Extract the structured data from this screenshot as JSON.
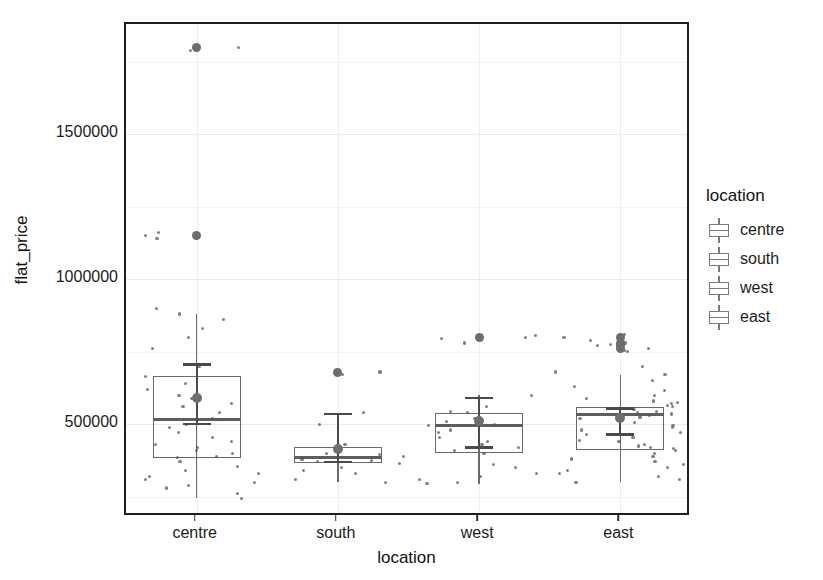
{
  "chart_data": {
    "type": "box",
    "title": "",
    "xlabel": "location",
    "ylabel": "flat_price",
    "categories": [
      "centre",
      "south",
      "west",
      "east"
    ],
    "xlim": [
      0.5,
      4.5
    ],
    "ylim": [
      180000,
      1880000
    ],
    "y_ticks": [
      500000,
      1000000,
      1500000
    ],
    "y_tick_labels": [
      "500000",
      "1000000",
      "1500000"
    ],
    "y_minor_ticks": [
      250000,
      750000,
      1250000,
      1750000
    ],
    "grid": true,
    "legend": {
      "title": "location",
      "position": "right",
      "entries": [
        "centre",
        "south",
        "west",
        "east"
      ]
    },
    "colors": {
      "box_stroke": "#6a6a6a",
      "median": "#5e5e5e",
      "point": "#555555",
      "outlier": "#6d6d6d",
      "mean_marker": "#4a4a4a",
      "panel_border": "#1e1e1e",
      "grid_major": "#eaeaea",
      "grid_minor": "#f4f4f4",
      "text": "#1c1c1c"
    },
    "series": [
      {
        "name": "centre",
        "q1": 385000,
        "median": 515000,
        "q3": 665000,
        "whisker_low": 245000,
        "whisker_high": 880000,
        "mean": 590000,
        "mean_ci_low": 500000,
        "mean_ci_high": 705000,
        "outliers": [
          1800000,
          1150000
        ],
        "points": [
          1800000,
          1790000,
          1160000,
          1150000,
          1140000,
          900000,
          880000,
          860000,
          830000,
          800000,
          760000,
          700000,
          665000,
          640000,
          620000,
          600000,
          590000,
          570000,
          560000,
          540000,
          520000,
          515000,
          500000,
          490000,
          470000,
          455000,
          440000,
          430000,
          420000,
          410000,
          400000,
          390000,
          385000,
          370000,
          355000,
          340000,
          330000,
          320000,
          310000,
          300000,
          290000,
          280000,
          260000,
          245000
        ]
      },
      {
        "name": "south",
        "q1": 365000,
        "median": 385000,
        "q3": 420000,
        "whisker_low": 300000,
        "whisker_high": 540000,
        "mean": 415000,
        "mean_ci_low": 370000,
        "mean_ci_high": 535000,
        "outliers": [
          680000
        ],
        "points": [
          680000,
          670000,
          540000,
          500000,
          430000,
          420000,
          410000,
          400000,
          395000,
          390000,
          385000,
          380000,
          375000,
          370000,
          365000,
          350000,
          340000,
          330000,
          310000,
          300000
        ]
      },
      {
        "name": "west",
        "q1": 400000,
        "median": 495000,
        "q3": 540000,
        "whisker_low": 295000,
        "whisker_high": 600000,
        "mean": 510000,
        "mean_ci_low": 420000,
        "mean_ci_high": 590000,
        "outliers": [
          800000
        ],
        "points": [
          805000,
          800000,
          795000,
          780000,
          600000,
          560000,
          545000,
          540000,
          520000,
          510000,
          500000,
          495000,
          480000,
          470000,
          455000,
          440000,
          430000,
          420000,
          410000,
          400000,
          360000,
          350000,
          330000,
          320000,
          310000,
          300000,
          295000
        ]
      },
      {
        "name": "east",
        "q1": 410000,
        "median": 535000,
        "q3": 560000,
        "whisker_low": 300000,
        "whisker_high": 670000,
        "mean": 520000,
        "mean_ci_low": 465000,
        "mean_ci_high": 555000,
        "outliers": [
          800000,
          780000,
          770000,
          760000
        ],
        "points": [
          810000,
          800000,
          790000,
          780000,
          775000,
          770000,
          760000,
          755000,
          750000,
          700000,
          680000,
          670000,
          650000,
          630000,
          615000,
          600000,
          590000,
          580000,
          575000,
          570000,
          565000,
          560000,
          555000,
          550000,
          545000,
          540000,
          535000,
          530000,
          525000,
          520000,
          515000,
          505000,
          495000,
          490000,
          480000,
          470000,
          465000,
          455000,
          445000,
          440000,
          430000,
          425000,
          420000,
          415000,
          410000,
          400000,
          390000,
          380000,
          370000,
          360000,
          350000,
          340000,
          330000,
          320000,
          310000,
          300000
        ]
      }
    ]
  }
}
